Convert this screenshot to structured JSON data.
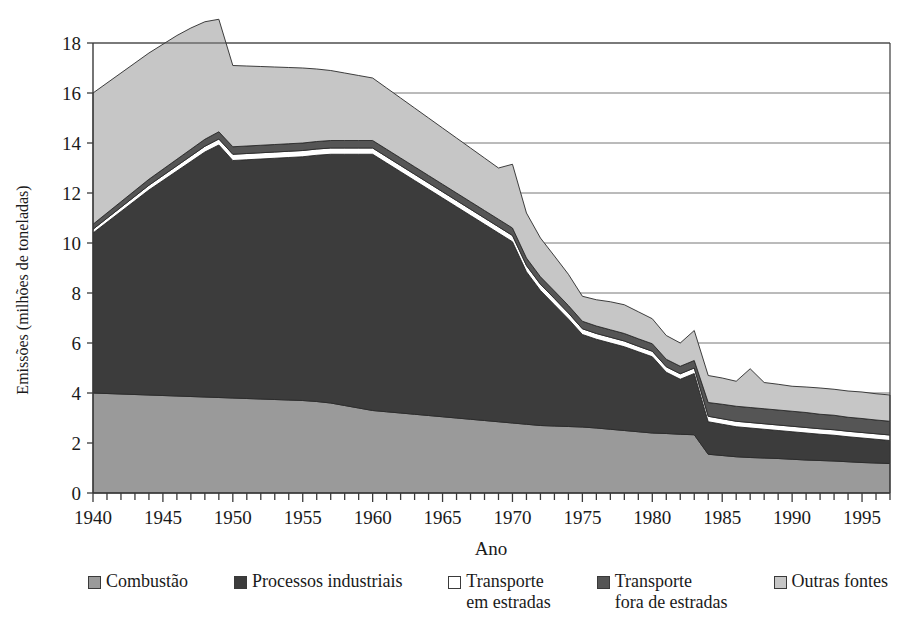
{
  "chart_data": {
    "type": "area",
    "title": "",
    "xlabel": "Ano",
    "ylabel": "Emissões (milhões de toneladas)",
    "stacked": true,
    "grid": true,
    "legend_position": "bottom",
    "xlim": [
      1940,
      1997
    ],
    "ylim": [
      0,
      18
    ],
    "ytick_step": 2,
    "xtick_major_step": 5,
    "xtick_minor_step": 1,
    "yticks": [
      0,
      2,
      4,
      6,
      8,
      10,
      12,
      14,
      16,
      18
    ],
    "xticks": [
      1940,
      1945,
      1950,
      1955,
      1960,
      1965,
      1970,
      1975,
      1980,
      1985,
      1990,
      1995
    ],
    "x": [
      1940,
      1941,
      1942,
      1943,
      1944,
      1945,
      1946,
      1947,
      1948,
      1949,
      1950,
      1951,
      1952,
      1953,
      1954,
      1955,
      1956,
      1957,
      1958,
      1959,
      1960,
      1961,
      1962,
      1963,
      1964,
      1965,
      1966,
      1967,
      1968,
      1969,
      1970,
      1971,
      1972,
      1973,
      1974,
      1975,
      1976,
      1977,
      1978,
      1979,
      1980,
      1981,
      1982,
      1983,
      1984,
      1985,
      1986,
      1987,
      1988,
      1989,
      1990,
      1991,
      1992,
      1993,
      1994,
      1995,
      1996,
      1997
    ],
    "series": [
      {
        "name": "Combustão",
        "color": "#9a9a9a",
        "values": [
          4.0,
          3.98,
          3.96,
          3.94,
          3.92,
          3.9,
          3.88,
          3.86,
          3.84,
          3.82,
          3.8,
          3.78,
          3.76,
          3.74,
          3.72,
          3.7,
          3.66,
          3.6,
          3.5,
          3.4,
          3.3,
          3.25,
          3.2,
          3.15,
          3.1,
          3.05,
          3.0,
          2.95,
          2.9,
          2.85,
          2.8,
          2.75,
          2.7,
          2.68,
          2.66,
          2.64,
          2.6,
          2.55,
          2.5,
          2.45,
          2.4,
          2.38,
          2.35,
          2.33,
          1.55,
          1.5,
          1.45,
          1.42,
          1.4,
          1.38,
          1.35,
          1.32,
          1.3,
          1.28,
          1.25,
          1.22,
          1.2,
          1.18
        ]
      },
      {
        "name": "Processos industriais",
        "color": "#3c3c3c",
        "values": [
          6.4,
          6.85,
          7.3,
          7.75,
          8.2,
          8.6,
          9.0,
          9.4,
          9.8,
          10.1,
          9.5,
          9.55,
          9.6,
          9.65,
          9.7,
          9.75,
          9.85,
          9.95,
          10.05,
          10.15,
          10.25,
          9.95,
          9.65,
          9.35,
          9.05,
          8.75,
          8.45,
          8.15,
          7.85,
          7.55,
          7.25,
          6.1,
          5.4,
          4.85,
          4.3,
          3.7,
          3.55,
          3.45,
          3.35,
          3.2,
          3.05,
          2.45,
          2.2,
          2.45,
          1.3,
          1.25,
          1.2,
          1.18,
          1.15,
          1.12,
          1.1,
          1.08,
          1.05,
          1.03,
          1.0,
          0.98,
          0.95,
          0.92
        ]
      },
      {
        "name": "Transporte\nem estradas",
        "color": "#ffffff",
        "values": [
          0.15,
          0.16,
          0.17,
          0.18,
          0.19,
          0.2,
          0.21,
          0.22,
          0.23,
          0.24,
          0.25,
          0.25,
          0.25,
          0.25,
          0.25,
          0.25,
          0.25,
          0.25,
          0.25,
          0.25,
          0.25,
          0.25,
          0.25,
          0.25,
          0.25,
          0.25,
          0.25,
          0.25,
          0.25,
          0.25,
          0.25,
          0.25,
          0.25,
          0.25,
          0.24,
          0.23,
          0.23,
          0.23,
          0.23,
          0.22,
          0.22,
          0.22,
          0.22,
          0.22,
          0.22,
          0.22,
          0.22,
          0.22,
          0.22,
          0.22,
          0.22,
          0.22,
          0.22,
          0.22,
          0.22,
          0.22,
          0.22,
          0.22
        ]
      },
      {
        "name": "Transporte\nfora de estradas",
        "color": "#555555",
        "values": [
          0.2,
          0.21,
          0.22,
          0.23,
          0.24,
          0.25,
          0.26,
          0.27,
          0.28,
          0.29,
          0.3,
          0.3,
          0.3,
          0.3,
          0.3,
          0.3,
          0.3,
          0.3,
          0.3,
          0.3,
          0.3,
          0.3,
          0.3,
          0.3,
          0.3,
          0.3,
          0.3,
          0.3,
          0.3,
          0.3,
          0.3,
          0.3,
          0.3,
          0.3,
          0.3,
          0.3,
          0.3,
          0.3,
          0.3,
          0.3,
          0.3,
          0.3,
          0.3,
          0.3,
          0.55,
          0.58,
          0.6,
          0.6,
          0.6,
          0.6,
          0.6,
          0.6,
          0.58,
          0.58,
          0.56,
          0.56,
          0.55,
          0.55
        ]
      },
      {
        "name": "Outras fontes",
        "color": "#c6c6c6",
        "values": [
          5.25,
          5.2,
          5.15,
          5.1,
          5.05,
          5.0,
          4.95,
          4.85,
          4.7,
          4.5,
          3.25,
          3.2,
          3.15,
          3.1,
          3.05,
          3.0,
          2.9,
          2.8,
          2.7,
          2.6,
          2.5,
          2.45,
          2.4,
          2.35,
          2.3,
          2.25,
          2.2,
          2.15,
          2.1,
          2.05,
          2.55,
          1.8,
          1.55,
          1.4,
          1.25,
          1.0,
          1.05,
          1.12,
          1.15,
          1.08,
          1.0,
          0.95,
          0.93,
          1.2,
          1.08,
          1.05,
          1.0,
          1.55,
          1.05,
          1.03,
          1.0,
          1.02,
          1.05,
          1.04,
          1.05,
          1.06,
          1.05,
          1.05
        ]
      }
    ],
    "totals": [
      16.0,
      16.4,
      16.8,
      17.2,
      17.6,
      17.95,
      18.3,
      18.6,
      18.85,
      18.95,
      17.1,
      17.08,
      17.06,
      17.04,
      17.02,
      17.0,
      16.96,
      16.9,
      16.8,
      16.7,
      16.6,
      16.2,
      15.8,
      15.4,
      15.0,
      14.6,
      14.2,
      13.8,
      13.4,
      13.0,
      13.15,
      11.2,
      10.2,
      9.48,
      8.75,
      7.87,
      7.73,
      7.65,
      7.53,
      7.25,
      6.97,
      6.3,
      6.0,
      6.5,
      4.7,
      4.6,
      4.47,
      4.97,
      4.42,
      4.35,
      4.27,
      4.24,
      4.2,
      4.15,
      4.08,
      4.04,
      3.97,
      3.92
    ]
  },
  "axes": {
    "ylabel": "Emissões (milhões de toneladas)",
    "xlabel": "Ano",
    "ytick_labels": [
      "0",
      "2",
      "4",
      "6",
      "8",
      "10",
      "12",
      "14",
      "16",
      "18"
    ],
    "xtick_labels": [
      "1940",
      "1945",
      "1950",
      "1955",
      "1960",
      "1965",
      "1970",
      "1975",
      "1980",
      "1985",
      "1990",
      "1995"
    ]
  },
  "legend": {
    "items": [
      {
        "label": "Combustão",
        "color": "#9a9a9a",
        "swatch": "legend-swatch-combustao"
      },
      {
        "label": "Processos industriais",
        "color": "#3c3c3c",
        "swatch": "legend-swatch-processos-industriais"
      },
      {
        "label": "Transporte\nem estradas",
        "color": "#ffffff",
        "swatch": "legend-swatch-transporte-em-estradas"
      },
      {
        "label": "Transporte\nfora de estradas",
        "color": "#555555",
        "swatch": "legend-swatch-transporte-fora-de-estradas"
      },
      {
        "label": "Outras fontes",
        "color": "#c6c6c6",
        "swatch": "legend-swatch-outras-fontes"
      }
    ]
  },
  "style": {
    "plot_border_color": "#3a3a3a",
    "grid_color": "#767676",
    "area_outline_color": "#2a2a2a",
    "background": "#ffffff"
  }
}
